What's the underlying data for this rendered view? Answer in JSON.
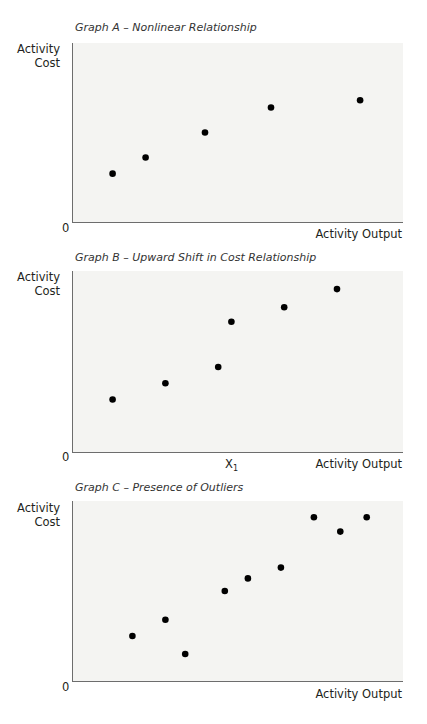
{
  "chart_data": [
    {
      "type": "scatter",
      "title": "Graph A – Nonlinear Relationship",
      "xlabel": "Activity Output",
      "ylabel": "Activity Cost",
      "origin_label": "0",
      "xlim": [
        0,
        100
      ],
      "ylim": [
        0,
        100
      ],
      "grid": false,
      "points": [
        {
          "x": 12,
          "y": 27
        },
        {
          "x": 22,
          "y": 36
        },
        {
          "x": 40,
          "y": 50
        },
        {
          "x": 60,
          "y": 64
        },
        {
          "x": 87,
          "y": 68
        }
      ]
    },
    {
      "type": "scatter",
      "title": "Graph B – Upward Shift in Cost Relationship",
      "xlabel": "Activity Output",
      "ylabel": "Activity Cost",
      "origin_label": "0",
      "x_tick_label": "X",
      "x_tick_sub": "1",
      "x_tick_pos": 48,
      "xlim": [
        0,
        100
      ],
      "ylim": [
        0,
        100
      ],
      "grid": false,
      "points": [
        {
          "x": 12,
          "y": 29
        },
        {
          "x": 28,
          "y": 38
        },
        {
          "x": 44,
          "y": 47
        },
        {
          "x": 48,
          "y": 72
        },
        {
          "x": 64,
          "y": 80
        },
        {
          "x": 80,
          "y": 90
        }
      ]
    },
    {
      "type": "scatter",
      "title": "Graph C – Presence of Outliers",
      "xlabel": "Activity Output",
      "ylabel": "Activity Cost",
      "origin_label": "0",
      "xlim": [
        0,
        100
      ],
      "ylim": [
        0,
        100
      ],
      "grid": false,
      "points": [
        {
          "x": 18,
          "y": 25
        },
        {
          "x": 28,
          "y": 34
        },
        {
          "x": 34,
          "y": 15
        },
        {
          "x": 46,
          "y": 50
        },
        {
          "x": 53,
          "y": 57
        },
        {
          "x": 63,
          "y": 63
        },
        {
          "x": 73,
          "y": 91
        },
        {
          "x": 81,
          "y": 83
        },
        {
          "x": 89,
          "y": 91
        }
      ]
    }
  ],
  "style": {
    "point_color": "#000000",
    "plot_bg": "#f4f4f2",
    "axis_color": "#6d6d6d"
  }
}
